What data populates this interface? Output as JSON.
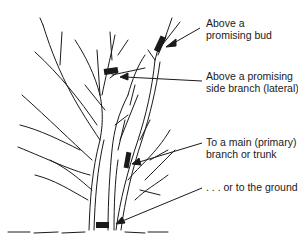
{
  "diagram": {
    "colors": {
      "ink": "#1a1a1a",
      "background": "#ffffff"
    },
    "labels": [
      {
        "id": "bud",
        "text": "Above a\npromising bud"
      },
      {
        "id": "lateral",
        "text": "Above a promising\nside branch (lateral)"
      },
      {
        "id": "main",
        "text": "To a main (primary)\nbranch or trunk"
      },
      {
        "id": "ground",
        "text": ". . . or to the ground"
      }
    ]
  }
}
